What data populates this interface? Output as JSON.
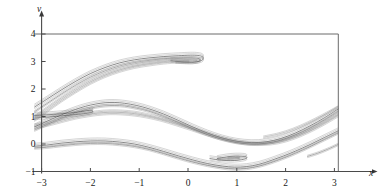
{
  "figure": {
    "name": "phase-portrait",
    "background": "#ffffff",
    "width": 384,
    "height": 196
  },
  "chart_data": {
    "type": "line",
    "title": "",
    "subtitle": "",
    "xlabel": "x",
    "ylabel": "v",
    "xlim": [
      -3.15,
      3.15
    ],
    "ylim": [
      -1.15,
      4.25
    ],
    "xticks": [
      -3,
      -2,
      -1,
      0,
      1,
      2,
      3
    ],
    "xticklabels": [
      "−3",
      "−2",
      "−1",
      "0",
      "1",
      "2",
      "3"
    ],
    "yticks": [
      -1,
      0,
      1,
      2,
      3,
      4
    ],
    "yticklabels": [
      "−1",
      "0",
      "1",
      "2",
      "3",
      "4"
    ],
    "grid": false,
    "legend": null,
    "legend_position": "none",
    "axis_style": {
      "x_axis_arrow": true,
      "y_axis_arrow": true,
      "frame_top": true,
      "frame_right": true,
      "axis_color": "#4a4a4a",
      "frame_color": "#6b6b6b",
      "curve_color": "#2b2b2b"
    },
    "annotations": [
      {
        "label": "upper cusp fold",
        "x": 0.25,
        "y": 3.1
      },
      {
        "label": "left small fold",
        "x": -2.05,
        "y": 1.2
      },
      {
        "label": "lower cusp fold",
        "x": 0.8,
        "y": -0.6
      }
    ],
    "series": [
      {
        "name": "upper-band-outer",
        "color": "#2b2b2b",
        "points": [
          [
            -3.15,
            1.34
          ],
          [
            -2.9,
            1.62
          ],
          [
            -2.6,
            1.96
          ],
          [
            -2.3,
            2.28
          ],
          [
            -2.0,
            2.56
          ],
          [
            -1.7,
            2.78
          ],
          [
            -1.4,
            2.95
          ],
          [
            -1.1,
            3.06
          ],
          [
            -0.8,
            3.13
          ],
          [
            -0.5,
            3.18
          ],
          [
            -0.2,
            3.21
          ],
          [
            0.05,
            3.23
          ],
          [
            0.2,
            3.22
          ],
          [
            0.3,
            3.17
          ],
          [
            0.3,
            3.06
          ],
          [
            0.18,
            2.99
          ],
          [
            0.0,
            2.98
          ],
          [
            -0.2,
            3.0
          ],
          [
            -0.35,
            3.03
          ]
        ]
      },
      {
        "name": "upper-band-inner",
        "color": "#555555",
        "points": [
          [
            -3.15,
            1.17
          ],
          [
            -2.9,
            1.46
          ],
          [
            -2.6,
            1.81
          ],
          [
            -2.3,
            2.14
          ],
          [
            -2.0,
            2.43
          ],
          [
            -1.7,
            2.66
          ],
          [
            -1.4,
            2.84
          ],
          [
            -1.1,
            2.96
          ],
          [
            -0.8,
            3.04
          ],
          [
            -0.5,
            3.1
          ],
          [
            -0.2,
            3.13
          ],
          [
            0.0,
            3.14
          ],
          [
            0.15,
            3.13
          ],
          [
            0.24,
            3.09
          ],
          [
            0.24,
            3.02
          ],
          [
            0.14,
            2.97
          ],
          [
            -0.02,
            2.96
          ],
          [
            -0.25,
            2.98
          ]
        ]
      },
      {
        "name": "upper-band-third",
        "color": "#808080",
        "points": [
          [
            -3.15,
            0.98
          ],
          [
            -2.9,
            1.3
          ],
          [
            -2.6,
            1.67
          ],
          [
            -2.3,
            2.01
          ],
          [
            -2.0,
            2.31
          ],
          [
            -1.7,
            2.55
          ],
          [
            -1.4,
            2.74
          ],
          [
            -1.1,
            2.87
          ],
          [
            -0.8,
            2.96
          ],
          [
            -0.5,
            3.02
          ],
          [
            -0.2,
            3.06
          ],
          [
            0.0,
            3.07
          ],
          [
            0.12,
            3.06
          ],
          [
            0.18,
            3.03
          ]
        ]
      },
      {
        "name": "upper-band-fourth",
        "color": "#808080",
        "points": [
          [
            -3.15,
            0.86
          ],
          [
            -2.9,
            1.18
          ],
          [
            -2.6,
            1.56
          ],
          [
            -2.3,
            1.9
          ],
          [
            -2.0,
            2.21
          ],
          [
            -1.7,
            2.46
          ],
          [
            -1.4,
            2.65
          ],
          [
            -1.1,
            2.79
          ],
          [
            -0.8,
            2.88
          ],
          [
            -0.5,
            2.95
          ],
          [
            -0.2,
            2.99
          ],
          [
            0.02,
            3.0
          ]
        ]
      },
      {
        "name": "mid-band-top",
        "color": "#2b2b2b",
        "points": [
          [
            -3.15,
            0.62
          ],
          [
            -2.85,
            0.86
          ],
          [
            -2.55,
            1.09
          ],
          [
            -2.3,
            1.26
          ],
          [
            -2.1,
            1.37
          ],
          [
            -1.9,
            1.45
          ],
          [
            -1.7,
            1.5
          ],
          [
            -1.5,
            1.51
          ],
          [
            -1.3,
            1.48
          ],
          [
            -1.05,
            1.4
          ],
          [
            -0.8,
            1.28
          ],
          [
            -0.5,
            1.09
          ],
          [
            -0.2,
            0.86
          ],
          [
            0.1,
            0.62
          ],
          [
            0.4,
            0.4
          ],
          [
            0.7,
            0.22
          ],
          [
            1.0,
            0.1
          ],
          [
            1.3,
            0.05
          ],
          [
            1.6,
            0.08
          ],
          [
            1.9,
            0.2
          ],
          [
            2.2,
            0.4
          ],
          [
            2.5,
            0.66
          ],
          [
            2.8,
            0.96
          ],
          [
            3.1,
            1.3
          ],
          [
            3.15,
            1.36
          ]
        ]
      },
      {
        "name": "mid-band-second",
        "color": "#555555",
        "points": [
          [
            -3.15,
            0.5
          ],
          [
            -2.85,
            0.74
          ],
          [
            -2.55,
            0.97
          ],
          [
            -2.3,
            1.14
          ],
          [
            -2.1,
            1.25
          ],
          [
            -1.9,
            1.34
          ],
          [
            -1.7,
            1.39
          ],
          [
            -1.5,
            1.4
          ],
          [
            -1.3,
            1.38
          ],
          [
            -1.05,
            1.3
          ],
          [
            -0.8,
            1.19
          ],
          [
            -0.5,
            1.0
          ],
          [
            -0.2,
            0.78
          ],
          [
            0.1,
            0.55
          ],
          [
            0.4,
            0.34
          ],
          [
            0.7,
            0.17
          ],
          [
            1.0,
            0.05
          ],
          [
            1.3,
            0.0
          ],
          [
            1.6,
            0.03
          ],
          [
            1.9,
            0.14
          ],
          [
            2.2,
            0.33
          ],
          [
            2.5,
            0.58
          ],
          [
            2.8,
            0.88
          ],
          [
            3.1,
            1.21
          ],
          [
            3.15,
            1.27
          ]
        ]
      },
      {
        "name": "mid-band-left-fold-upper",
        "color": "#2b2b2b",
        "points": [
          [
            -3.15,
            1.04
          ],
          [
            -2.9,
            1.06
          ],
          [
            -2.6,
            1.1
          ],
          [
            -2.35,
            1.14
          ],
          [
            -2.15,
            1.19
          ],
          [
            -2.02,
            1.22
          ],
          [
            -1.95,
            1.2
          ],
          [
            -1.98,
            1.15
          ],
          [
            -2.1,
            1.11
          ],
          [
            -2.3,
            1.07
          ],
          [
            -2.55,
            1.03
          ],
          [
            -2.85,
            0.98
          ],
          [
            -3.15,
            0.94
          ]
        ]
      },
      {
        "name": "mid-band-third",
        "color": "#808080",
        "points": [
          [
            -3.15,
            0.68
          ],
          [
            -2.85,
            0.8
          ],
          [
            -2.55,
            0.94
          ],
          [
            -2.3,
            1.04
          ],
          [
            -2.05,
            1.12
          ],
          [
            -1.85,
            1.17
          ],
          [
            -1.6,
            1.2
          ],
          [
            -1.35,
            1.19
          ],
          [
            -1.1,
            1.15
          ],
          [
            -0.85,
            1.07
          ],
          [
            -0.55,
            0.94
          ],
          [
            -0.25,
            0.78
          ],
          [
            0.05,
            0.6
          ],
          [
            0.35,
            0.42
          ],
          [
            0.65,
            0.25
          ],
          [
            0.95,
            0.12
          ],
          [
            1.25,
            0.04
          ],
          [
            1.55,
            0.03
          ],
          [
            1.85,
            0.1
          ],
          [
            2.15,
            0.26
          ],
          [
            2.45,
            0.48
          ],
          [
            2.75,
            0.76
          ],
          [
            3.05,
            1.07
          ],
          [
            3.15,
            1.18
          ]
        ]
      },
      {
        "name": "mid-band-fourth",
        "color": "#808080",
        "points": [
          [
            -3.15,
            0.58
          ],
          [
            -2.85,
            0.7
          ],
          [
            -2.55,
            0.84
          ],
          [
            -2.3,
            0.95
          ],
          [
            -2.05,
            1.03
          ],
          [
            -1.85,
            1.08
          ],
          [
            -1.6,
            1.11
          ],
          [
            -1.35,
            1.1
          ],
          [
            -1.1,
            1.06
          ],
          [
            -0.85,
            0.99
          ],
          [
            -0.55,
            0.87
          ],
          [
            -0.25,
            0.71
          ],
          [
            0.05,
            0.54
          ],
          [
            0.35,
            0.36
          ],
          [
            0.65,
            0.2
          ],
          [
            0.95,
            0.08
          ],
          [
            1.25,
            0.0
          ],
          [
            1.55,
            -0.01
          ],
          [
            1.85,
            0.05
          ],
          [
            2.15,
            0.2
          ],
          [
            2.45,
            0.42
          ],
          [
            2.75,
            0.69
          ],
          [
            3.05,
            1.0
          ],
          [
            3.15,
            1.11
          ]
        ]
      },
      {
        "name": "lower-band-top",
        "color": "#2b2b2b",
        "points": [
          [
            -3.15,
            -0.08
          ],
          [
            -2.9,
            -0.04
          ],
          [
            -2.6,
            0.03
          ],
          [
            -2.3,
            0.08
          ],
          [
            -2.0,
            0.11
          ],
          [
            -1.7,
            0.11
          ],
          [
            -1.4,
            0.07
          ],
          [
            -1.1,
            0.0
          ],
          [
            -0.8,
            -0.12
          ],
          [
            -0.5,
            -0.27
          ],
          [
            -0.2,
            -0.43
          ],
          [
            0.1,
            -0.58
          ],
          [
            0.4,
            -0.71
          ],
          [
            0.7,
            -0.8
          ],
          [
            0.95,
            -0.84
          ],
          [
            1.2,
            -0.82
          ],
          [
            1.45,
            -0.74
          ],
          [
            1.7,
            -0.6
          ],
          [
            1.95,
            -0.44
          ],
          [
            2.2,
            -0.26
          ],
          [
            2.5,
            -0.02
          ],
          [
            2.8,
            0.24
          ],
          [
            3.1,
            0.5
          ],
          [
            3.15,
            0.55
          ]
        ]
      },
      {
        "name": "lower-band-second",
        "color": "#555555",
        "points": [
          [
            -3.15,
            -0.15
          ],
          [
            -2.9,
            -0.12
          ],
          [
            -2.6,
            -0.06
          ],
          [
            -2.3,
            -0.01
          ],
          [
            -2.0,
            0.02
          ],
          [
            -1.7,
            0.02
          ],
          [
            -1.4,
            -0.02
          ],
          [
            -1.1,
            -0.09
          ],
          [
            -0.8,
            -0.2
          ],
          [
            -0.5,
            -0.35
          ],
          [
            -0.2,
            -0.51
          ],
          [
            0.1,
            -0.66
          ],
          [
            0.4,
            -0.78
          ],
          [
            0.7,
            -0.87
          ],
          [
            0.95,
            -0.91
          ],
          [
            1.2,
            -0.89
          ],
          [
            1.45,
            -0.81
          ],
          [
            1.7,
            -0.68
          ],
          [
            1.95,
            -0.52
          ],
          [
            2.2,
            -0.34
          ],
          [
            2.5,
            -0.1
          ],
          [
            2.8,
            0.16
          ],
          [
            3.1,
            0.42
          ],
          [
            3.15,
            0.47
          ]
        ]
      },
      {
        "name": "lower-cusp-outer",
        "color": "#2b2b2b",
        "points": [
          [
            0.45,
            -0.53
          ],
          [
            0.6,
            -0.57
          ],
          [
            0.78,
            -0.6
          ],
          [
            0.95,
            -0.6
          ],
          [
            1.1,
            -0.57
          ],
          [
            1.2,
            -0.52
          ],
          [
            1.18,
            -0.46
          ],
          [
            1.05,
            -0.44
          ],
          [
            0.88,
            -0.45
          ],
          [
            0.72,
            -0.49
          ],
          [
            0.6,
            -0.53
          ]
        ]
      },
      {
        "name": "lower-cusp-inner",
        "color": "#808080",
        "points": [
          [
            0.62,
            -0.55
          ],
          [
            0.78,
            -0.56
          ],
          [
            0.93,
            -0.56
          ],
          [
            1.04,
            -0.53
          ],
          [
            1.05,
            -0.49
          ],
          [
            0.95,
            -0.48
          ],
          [
            0.82,
            -0.5
          ]
        ]
      },
      {
        "name": "right-tail-lower",
        "color": "#555555",
        "points": [
          [
            2.45,
            -0.45
          ],
          [
            2.65,
            -0.34
          ],
          [
            2.85,
            -0.2
          ],
          [
            3.05,
            -0.04
          ],
          [
            3.15,
            0.05
          ]
        ]
      },
      {
        "name": "right-extra-upper",
        "color": "#808080",
        "points": [
          [
            1.55,
            0.25
          ],
          [
            1.85,
            0.36
          ],
          [
            2.15,
            0.53
          ],
          [
            2.45,
            0.76
          ],
          [
            2.75,
            1.03
          ],
          [
            3.05,
            1.32
          ],
          [
            3.15,
            1.42
          ]
        ]
      }
    ]
  },
  "axis_labels": {
    "x": "x",
    "y": "v"
  }
}
